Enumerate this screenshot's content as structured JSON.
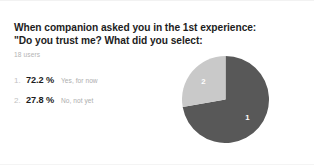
{
  "card": {
    "title_line_1": "When companion asked you in the 1st experience:",
    "title_line_2": "\"Do you trust me? What did you select:",
    "subtitle": "18 users"
  },
  "legend": {
    "rows": [
      {
        "rank": "1.",
        "percent": "72.2 %",
        "label": "Yes, for now"
      },
      {
        "rank": "2.",
        "percent": "27.8 %",
        "label": "No, not yet"
      }
    ]
  },
  "colors": {
    "slice_1": "#585858",
    "slice_2": "#c9c9c9",
    "title_text": "#1d1d1d",
    "muted_text": "#b0b0b0",
    "background": "#ffffff"
  },
  "pie": {
    "slice_1_number": "1",
    "slice_2_number": "2"
  },
  "chart_data": {
    "type": "pie",
    "title": "When companion asked you in the 1st experience: \"Do you trust me? What did you select:",
    "subtitle": "18 users",
    "total_users": 18,
    "categories": [
      "Yes, for now",
      "No, not yet"
    ],
    "values": [
      72.2,
      27.8
    ],
    "value_unit": "%",
    "counts": [
      13,
      5
    ],
    "slice_labels": [
      "1",
      "2"
    ],
    "colors": [
      "#585858",
      "#c9c9c9"
    ],
    "start_angle_deg": 0,
    "direction": "clockwise",
    "legend": "left",
    "grid": false
  }
}
